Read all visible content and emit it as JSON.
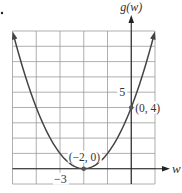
{
  "chart_data": {
    "type": "line",
    "title": "",
    "function": "g(w) = (w + 2)^2",
    "xlabel": "w",
    "ylabel": "g(w)",
    "xlim": [
      -5,
      1
    ],
    "ylim": [
      -1,
      9
    ],
    "grid": true,
    "tick_labels": {
      "x": [
        {
          "value": -3,
          "label": "−3"
        }
      ],
      "y": [
        {
          "value": 5,
          "label": "5"
        }
      ]
    },
    "series": [
      {
        "name": "g(w)",
        "x": [
          -5,
          -4.5,
          -4,
          -3.5,
          -3,
          -2.5,
          -2,
          -1.5,
          -1,
          -0.5,
          0,
          0.5,
          1
        ],
        "values": [
          9,
          6.25,
          4,
          2.25,
          1,
          0.25,
          0,
          0.25,
          1,
          2.25,
          4,
          6.25,
          9
        ]
      }
    ],
    "annotations": [
      {
        "point": [
          -2,
          0
        ],
        "label": "(−2, 0)"
      },
      {
        "point": [
          0,
          4
        ],
        "label": "(0, 4)"
      }
    ],
    "legend": null
  },
  "labels": {
    "y_axis": "g(w)",
    "x_axis": "w",
    "x_tick": "−3",
    "y_tick": "5",
    "vertex": "(−2, 0)",
    "intercept": "(0, 4)"
  },
  "colors": {
    "curve": "#444444",
    "grid": "#9a9a9a",
    "axis": "#222222",
    "point": "#555555"
  }
}
